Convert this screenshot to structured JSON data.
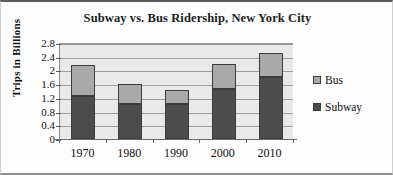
{
  "chart_data": {
    "type": "bar",
    "subtype": "stacked-bar",
    "title": "Subway vs. Bus Ridership, New York City",
    "xlabel": "",
    "ylabel": "Trips in Billions",
    "categories": [
      "1970",
      "1980",
      "1990",
      "2000",
      "2010"
    ],
    "series": [
      {
        "name": "Subway",
        "color": "#4c4c4c",
        "values": [
          1.25,
          1.02,
          1.02,
          1.45,
          1.82
        ]
      },
      {
        "name": "Bus",
        "color": "#a9a9a9",
        "values": [
          0.9,
          0.58,
          0.41,
          0.75,
          0.68
        ]
      }
    ],
    "totals": [
      2.15,
      1.6,
      1.43,
      2.2,
      2.5
    ],
    "ylim": [
      0,
      2.8
    ],
    "yticks": [
      "2.8",
      "2.4",
      "2",
      "1.6",
      "1.2",
      "0.8",
      "0.4",
      "0"
    ],
    "ytick_values": [
      2.8,
      2.4,
      2.0,
      1.6,
      1.2,
      0.8,
      0.4,
      0
    ],
    "grid": true,
    "legend_position": "right",
    "legend": [
      "Bus",
      "Subway"
    ],
    "plot_background": "#e9e9e9",
    "gridline_color": "#9d9d9d"
  }
}
